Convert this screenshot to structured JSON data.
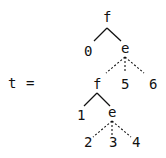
{
  "equation": {
    "lhs": "t",
    "op": "="
  },
  "tree": {
    "nodes": [
      {
        "id": "root",
        "label": "f",
        "x": 107,
        "y": 22
      },
      {
        "id": "n0",
        "label": "0",
        "x": 88,
        "y": 56
      },
      {
        "id": "e1",
        "label": "e",
        "x": 125,
        "y": 53
      },
      {
        "id": "f2",
        "label": "f",
        "x": 97,
        "y": 89
      },
      {
        "id": "n5",
        "label": "5",
        "x": 125,
        "y": 89
      },
      {
        "id": "n6",
        "label": "6",
        "x": 153,
        "y": 89
      },
      {
        "id": "n1",
        "label": "1",
        "x": 81,
        "y": 120
      },
      {
        "id": "e2",
        "label": "e",
        "x": 112,
        "y": 117
      },
      {
        "id": "n2",
        "label": "2",
        "x": 88,
        "y": 147
      },
      {
        "id": "n3",
        "label": "3",
        "x": 113,
        "y": 147
      },
      {
        "id": "n4",
        "label": "4",
        "x": 136,
        "y": 147
      }
    ],
    "edges": [
      {
        "from": "root",
        "to": "n0",
        "style": "solid"
      },
      {
        "from": "root",
        "to": "e1",
        "style": "solid"
      },
      {
        "from": "e1",
        "to": "f2",
        "style": "dashed"
      },
      {
        "from": "e1",
        "to": "n5",
        "style": "dashed"
      },
      {
        "from": "e1",
        "to": "n6",
        "style": "dashed"
      },
      {
        "from": "f2",
        "to": "n1",
        "style": "solid"
      },
      {
        "from": "f2",
        "to": "e2",
        "style": "solid"
      },
      {
        "from": "e2",
        "to": "n2",
        "style": "dashed"
      },
      {
        "from": "e2",
        "to": "n3",
        "style": "dashed"
      },
      {
        "from": "e2",
        "to": "n4",
        "style": "dashed"
      }
    ]
  },
  "colors": {
    "ink": "#111111",
    "background": "#ffffff"
  }
}
